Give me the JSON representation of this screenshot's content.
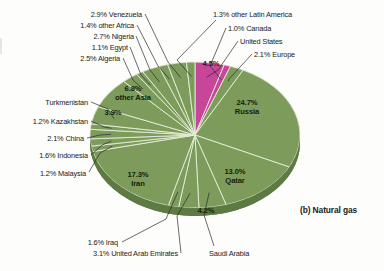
{
  "caption": "(b) Natural gas",
  "colors": {
    "green": "#7d9c5c",
    "green_dark": "#5d7b42",
    "green_rim": "#4e6b36",
    "pink": "#c8469a",
    "pink_dark": "#a33179",
    "divider": "#e8eede",
    "leader": "#2b2b2b",
    "text": "#1a1a1a",
    "background": "#fdfdfb"
  },
  "chart_data": {
    "type": "pie",
    "title": "(b) Natural gas",
    "unit": "percent of world natural gas reserves",
    "legend_position": "none",
    "labels_outside": [
      "2.9% Venezuela",
      "1.4% other Africa",
      "2.7% Nigeria",
      "1.1% Egypt",
      "2.5% Algeria",
      "Turkmenistan",
      "1.2% Kazakhstan",
      "2.1% China",
      "1.6% Indonesia",
      "1.2% Malaysia",
      "1.6% Iraq",
      "3.1% United Arab Emirates",
      "Saudi Arabia",
      "1.3% other Latin America",
      "1.0% Canada",
      "United States",
      "2.1% Europe"
    ],
    "categories": [
      "United States",
      "Canada",
      "Europe",
      "Russia",
      "Qatar",
      "Saudi Arabia",
      "United Arab Emirates",
      "Iraq",
      "Iran",
      "Malaysia",
      "Indonesia",
      "China",
      "Kazakhstan",
      "Turkmenistan",
      "other Asia",
      "Algeria",
      "Egypt",
      "Nigeria",
      "other Africa",
      "Venezuela",
      "other Latin America"
    ],
    "values": [
      4.5,
      1.0,
      2.1,
      24.7,
      13.0,
      4.2,
      3.1,
      1.6,
      17.3,
      1.2,
      1.6,
      2.1,
      1.2,
      3.9,
      6.8,
      2.5,
      1.1,
      2.7,
      1.4,
      2.9,
      1.3
    ],
    "series": [
      {
        "name": "World natural gas reserves",
        "values": [
          4.5,
          1.0,
          2.1,
          24.7,
          13.0,
          4.2,
          3.1,
          1.6,
          17.3,
          1.2,
          1.6,
          2.1,
          1.2,
          3.9,
          6.8,
          2.5,
          1.1,
          2.7,
          1.4,
          2.9,
          1.3
        ]
      }
    ],
    "slice_colors": [
      "pink",
      "pink",
      "green",
      "green",
      "green",
      "green",
      "green",
      "green",
      "green",
      "green",
      "green",
      "green",
      "green",
      "green",
      "green",
      "green",
      "green",
      "green",
      "green",
      "green",
      "green"
    ]
  },
  "slices": {
    "united_states": {
      "pct": "4.5%",
      "name": "United States"
    },
    "canada": {
      "pct": "1.0%",
      "name": "Canada"
    },
    "europe": {
      "pct": "2.1%",
      "name": "Europe"
    },
    "russia": {
      "pct": "24.7%",
      "name": "Russia"
    },
    "qatar": {
      "pct": "13.0%",
      "name": "Qatar"
    },
    "saudi_arabia": {
      "pct": "4.2%",
      "name": "Saudi Arabia"
    },
    "uae": {
      "pct": "3.1%",
      "name": "United Arab Emirates"
    },
    "iraq": {
      "pct": "1.6%",
      "name": "Iraq"
    },
    "iran": {
      "pct": "17.3%",
      "name": "Iran"
    },
    "malaysia": {
      "pct": "1.2%",
      "name": "Malaysia"
    },
    "indonesia": {
      "pct": "1.6%",
      "name": "Indonesia"
    },
    "china": {
      "pct": "2.1%",
      "name": "China"
    },
    "kazakhstan": {
      "pct": "1.2%",
      "name": "Kazakhstan"
    },
    "turkmenistan": {
      "pct": "3.9%",
      "name": "Turkmenistan"
    },
    "other_asia": {
      "pct": "6.8%",
      "name": "other Asia"
    },
    "algeria": {
      "pct": "2.5%",
      "name": "Algeria"
    },
    "egypt": {
      "pct": "1.1%",
      "name": "Egypt"
    },
    "nigeria": {
      "pct": "2.7%",
      "name": "Nigeria"
    },
    "other_africa": {
      "pct": "1.4%",
      "name": "other Africa"
    },
    "venezuela": {
      "pct": "2.9%",
      "name": "Venezuela"
    },
    "other_latin_america": {
      "pct": "1.3%",
      "name": "other Latin America"
    }
  },
  "labels": {
    "venezuela": "2.9% Venezuela",
    "other_africa": "1.4% other Africa",
    "nigeria": "2.7% Nigeria",
    "egypt": "1.1% Egypt",
    "algeria": "2.5% Algeria",
    "turkmenistan": "Turkmenistan",
    "kazakhstan": "1.2% Kazakhstan",
    "china": "2.1% China",
    "indonesia": "1.6% Indonesia",
    "malaysia": "1.2% Malaysia",
    "iraq": "1.6% Iraq",
    "uae": "3.1% United Arab Emirates",
    "saudi_arabia": "Saudi Arabia",
    "other_latin_america": "1.3% other Latin America",
    "canada": "1.0% Canada",
    "united_states": "United States",
    "europe": "2.1% Europe",
    "us_inpie": "4.5%",
    "russia_pct": "24.7%",
    "russia_name": "Russia",
    "qatar_pct": "13.0%",
    "qatar_name": "Qatar",
    "iran_pct": "17.3%",
    "iran_name": "Iran",
    "saudi_pct": "4.2%",
    "other_asia_pct": "6.8%",
    "other_asia_name": "other Asia",
    "turkmenistan_pct": "3.9%"
  }
}
